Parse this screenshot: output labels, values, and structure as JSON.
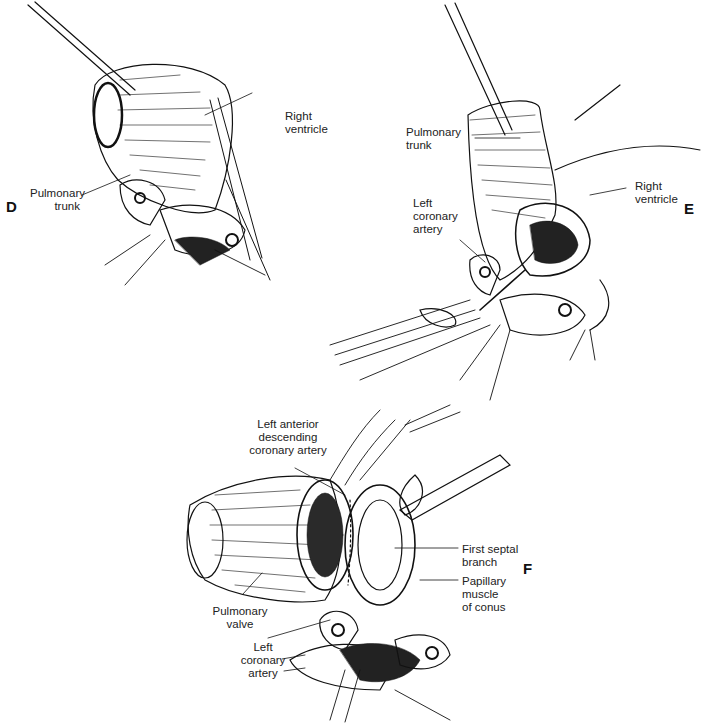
{
  "figure": {
    "panels": [
      {
        "id": "D",
        "letter": "D",
        "labels": [
          {
            "key": "pulmonary_trunk",
            "text": "Pulmonary\ntrunk"
          },
          {
            "key": "right_ventricle",
            "text": "Right\nventricle"
          }
        ]
      },
      {
        "id": "E",
        "letter": "E",
        "labels": [
          {
            "key": "pulmonary_trunk",
            "text": "Pulmonary\ntrunk"
          },
          {
            "key": "right_ventricle",
            "text": "Right\nventricle"
          },
          {
            "key": "left_coronary_artery",
            "text": "Left\ncoronary\nartery"
          }
        ]
      },
      {
        "id": "F",
        "letter": "F",
        "labels": [
          {
            "key": "lad",
            "text": "Left anterior\ndescending\ncoronary artery"
          },
          {
            "key": "first_septal",
            "text": "First septal\nbranch"
          },
          {
            "key": "papillary",
            "text": "Papillary\nmuscle\nof conus"
          },
          {
            "key": "pulmonary_valve",
            "text": "Pulmonary\nvalve"
          },
          {
            "key": "left_coronary_artery",
            "text": "Left\ncoronary\nartery"
          }
        ]
      }
    ]
  }
}
